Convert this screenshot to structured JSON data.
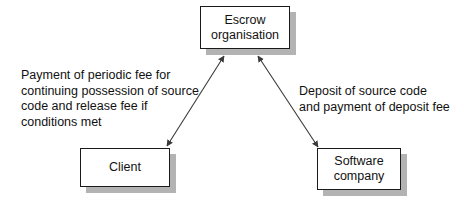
{
  "diagram": {
    "nodes": [
      {
        "id": "escrow",
        "label": "Escrow\norganisation"
      },
      {
        "id": "client",
        "label": "Client"
      },
      {
        "id": "software",
        "label": "Software\ncompany"
      }
    ],
    "edges": [
      {
        "id": "escrow-client",
        "from": "escrow",
        "to": "client",
        "arrows": "both",
        "label": "Payment of periodic fee for\ncontinuing possession of source\ncode and release fee if\nconditions met"
      },
      {
        "id": "escrow-software",
        "from": "escrow",
        "to": "software",
        "arrows": "both",
        "label": "Deposit of source code\nand payment of deposit fee"
      }
    ],
    "colors": {
      "background": "#ffffff",
      "box_fill": "#ffffff",
      "box_border": "#1a1a1a",
      "box_shadow": "#b3b3b3",
      "text": "#111111",
      "connector": "#3a3a3a"
    }
  }
}
